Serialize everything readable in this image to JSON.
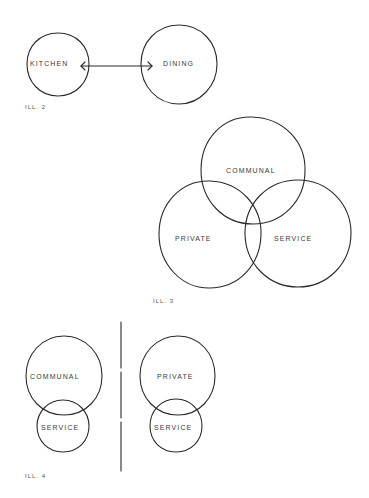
{
  "illustrations": [
    {
      "id": "ill2",
      "caption": "ILL. 2",
      "nodes": [
        {
          "label": "KITCHEN",
          "cx": 58,
          "cy": 64,
          "r": 31
        },
        {
          "label": "DINING",
          "cx": 179,
          "cy": 64,
          "r": 39
        }
      ],
      "connector": {
        "type": "double-arrow",
        "from": "KITCHEN",
        "to": "DINING"
      }
    },
    {
      "id": "ill3",
      "caption": "ILL. 3",
      "nodes": [
        {
          "label": "COMMUNAL",
          "cx": 253,
          "cy": 170,
          "r": 53
        },
        {
          "label": "PRIVATE",
          "cx": 210,
          "cy": 234,
          "r": 52
        },
        {
          "label": "SERVICE",
          "cx": 298,
          "cy": 233,
          "r": 53
        }
      ]
    },
    {
      "id": "ill4",
      "caption": "ILL. 4",
      "groups": [
        {
          "top": {
            "label": "COMMUNAL",
            "cx": 64,
            "cy": 376,
            "r": 39
          },
          "bottom": {
            "label": "SERVICE",
            "cx": 63,
            "cy": 426,
            "r": 26
          }
        },
        {
          "top": {
            "label": "PRIVATE",
            "cx": 178,
            "cy": 376,
            "r": 38
          },
          "bottom": {
            "label": "SERVICE",
            "cx": 176,
            "cy": 426,
            "r": 26
          }
        }
      ],
      "divider": {
        "type": "vertical-line",
        "x": 121
      }
    }
  ],
  "labels": {
    "ill2_kitchen": "KITCHEN",
    "ill2_dining": "DINING",
    "ill2_caption": "ILL. 2",
    "ill3_communal": "COMMUNAL",
    "ill3_private": "PRIVATE",
    "ill3_service": "SERVICE",
    "ill3_caption": "ILL. 3",
    "ill4_communal": "COMMUNAL",
    "ill4_service_left": "SERVICE",
    "ill4_private": "PRIVATE",
    "ill4_service_right": "SERVICE",
    "ill4_caption": "ILL. 4"
  },
  "colors": {
    "ink": "#2a2a2a",
    "paper": "#ffffff"
  }
}
